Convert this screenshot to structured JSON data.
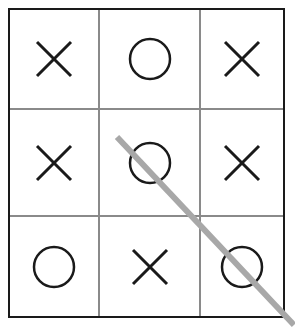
{
  "game": {
    "name": "tic-tac-toe",
    "board": [
      [
        "X",
        "O",
        "X"
      ],
      [
        "X",
        "O",
        "X"
      ],
      [
        "O",
        "X",
        "O"
      ]
    ],
    "winning_line": {
      "type": "diagonal",
      "cells": [
        [
          1,
          1
        ],
        [
          2,
          2
        ]
      ],
      "color": "#a8a8a8"
    }
  },
  "colors": {
    "mark": "#1a1a1a",
    "outer_border": "#1a1a1a",
    "grid_line": "#8a8a8a",
    "background": "#ffffff"
  }
}
